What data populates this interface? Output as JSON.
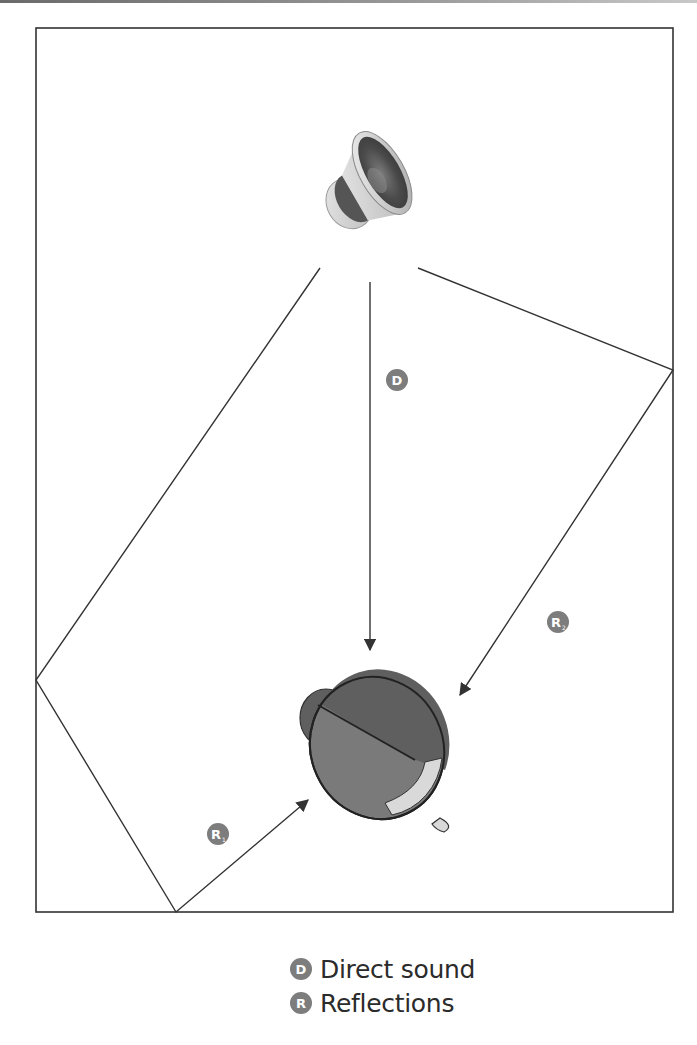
{
  "figure": {
    "title": "",
    "room_outline": {
      "x": 36,
      "y": 28,
      "width": 637,
      "height": 884,
      "stroke": "#333333"
    },
    "source": {
      "name": "loudspeaker",
      "x": 370,
      "y": 175
    },
    "listener": {
      "name": "listener-head",
      "x": 375,
      "y": 750
    },
    "paths": {
      "direct": {
        "label": "D",
        "from": [
          370,
          282
        ],
        "to": [
          370,
          650
        ]
      },
      "reflection_right": {
        "label": "R",
        "subscript": "2",
        "points": [
          [
            418,
            268
          ],
          [
            673,
            370
          ],
          [
            460,
            695
          ]
        ]
      },
      "reflection_left": {
        "label": "R",
        "subscript": "1",
        "points": [
          [
            320,
            268
          ],
          [
            36,
            680
          ],
          [
            176,
            912
          ],
          [
            308,
            800
          ]
        ]
      }
    },
    "badges": [
      {
        "id": "D",
        "text": "D",
        "sub": "",
        "x": 397,
        "y": 380
      },
      {
        "id": "R2",
        "text": "R",
        "sub": "2",
        "x": 558,
        "y": 622
      },
      {
        "id": "R1",
        "text": "R",
        "sub": "1",
        "x": 218,
        "y": 834
      }
    ],
    "colors": {
      "line": "#333333",
      "badge": "#7d7d7d",
      "head_dark": "#5f5f5f",
      "head_mid": "#7a7a7a",
      "head_light": "#d9d9d9",
      "text": "#2b2b2b"
    }
  },
  "legend": {
    "items": [
      {
        "badge": "D",
        "label": "Direct sound"
      },
      {
        "badge": "R",
        "label": "Reflections"
      }
    ]
  }
}
